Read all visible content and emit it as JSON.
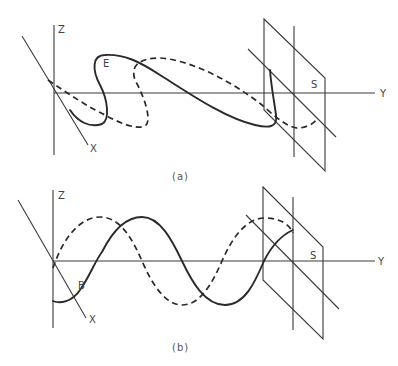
{
  "figure": {
    "panels": [
      {
        "caption": "(a)",
        "axes": {
          "z": "Z",
          "x": "X",
          "y": "Y"
        },
        "plane_label": "S",
        "curve_label": "E",
        "curves": [
          {
            "name": "solid-wave",
            "style": "solid"
          },
          {
            "name": "dashed-wave",
            "style": "dashed"
          }
        ]
      },
      {
        "caption": "(b)",
        "axes": {
          "z": "Z",
          "x": "X",
          "y": "Y"
        },
        "plane_label": "S",
        "curve_label": "B",
        "curves": [
          {
            "name": "solid-wave",
            "style": "solid"
          },
          {
            "name": "dashed-wave",
            "style": "dashed"
          }
        ]
      }
    ],
    "colors": {
      "line": "#2a2a2a",
      "background": "#ffffff"
    }
  }
}
